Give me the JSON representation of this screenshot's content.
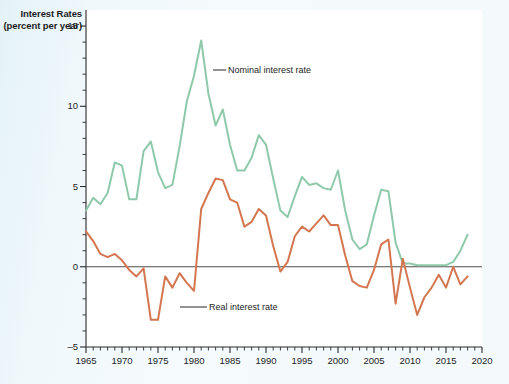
{
  "figure": {
    "background_color": "#f4fafc",
    "plot_background_color": "#ffffff"
  },
  "axis_title": {
    "line1": "Interest Rates",
    "line2": "(percent per year)"
  },
  "annotations": {
    "nominal": "Nominal interest rate",
    "real": "Real interest rate"
  },
  "chart_data": {
    "type": "line",
    "title": "",
    "xlabel": "",
    "ylabel": "Interest Rates (percent per year)",
    "xlim": [
      1965,
      2020
    ],
    "ylim": [
      -5,
      16
    ],
    "grid": false,
    "legend_position": "inline-annotation",
    "y_ticks_major": [
      -5,
      0,
      5,
      10,
      15
    ],
    "y_ticks_minor_step": 1,
    "x_ticks_major": [
      1965,
      1970,
      1975,
      1980,
      1985,
      1990,
      1995,
      2000,
      2005,
      2010,
      2015,
      2020
    ],
    "x_ticks_minor_step": 1,
    "zero_line": 0,
    "zero_line_color": "#4c4c4c",
    "x": [
      1965,
      1966,
      1967,
      1968,
      1969,
      1970,
      1971,
      1972,
      1973,
      1974,
      1975,
      1976,
      1977,
      1978,
      1979,
      1980,
      1981,
      1982,
      1983,
      1984,
      1985,
      1986,
      1987,
      1988,
      1989,
      1990,
      1991,
      1992,
      1993,
      1994,
      1995,
      1996,
      1997,
      1998,
      1999,
      2000,
      2001,
      2002,
      2003,
      2004,
      2005,
      2006,
      2007,
      2008,
      2009,
      2010,
      2011,
      2012,
      2013,
      2014,
      2015,
      2016,
      2017,
      2018
    ],
    "series": [
      {
        "name": "Nominal interest rate",
        "color": "#8fc9ab",
        "values": [
          3.5,
          4.3,
          3.9,
          4.6,
          6.5,
          6.3,
          4.2,
          4.2,
          7.2,
          7.8,
          5.9,
          4.9,
          5.1,
          7.5,
          10.3,
          11.9,
          14.1,
          10.8,
          8.8,
          9.8,
          7.6,
          6.0,
          6.0,
          6.8,
          8.2,
          7.6,
          5.5,
          3.5,
          3.1,
          4.4,
          5.6,
          5.1,
          5.2,
          4.9,
          4.8,
          6.0,
          3.5,
          1.7,
          1.1,
          1.4,
          3.2,
          4.8,
          4.7,
          1.5,
          0.2,
          0.2,
          0.1,
          0.1,
          0.1,
          0.1,
          0.1,
          0.3,
          1.0,
          2.0
        ]
      },
      {
        "name": "Real interest rate",
        "color": "#d4764f",
        "values": [
          2.2,
          1.6,
          0.8,
          0.6,
          0.8,
          0.4,
          -0.2,
          -0.6,
          -0.1,
          -3.3,
          -3.3,
          -0.6,
          -1.3,
          -0.4,
          -1.0,
          -1.5,
          3.6,
          4.6,
          5.5,
          5.4,
          4.2,
          4.0,
          2.5,
          2.8,
          3.6,
          3.2,
          1.3,
          -0.3,
          0.3,
          1.9,
          2.5,
          2.2,
          2.7,
          3.2,
          2.6,
          2.6,
          0.7,
          -0.9,
          -1.2,
          -1.3,
          -0.2,
          1.4,
          1.7,
          -2.3,
          0.5,
          -1.3,
          -3.0,
          -1.9,
          -1.3,
          -0.5,
          -1.3,
          0.0,
          -1.1,
          -0.6
        ]
      }
    ]
  }
}
